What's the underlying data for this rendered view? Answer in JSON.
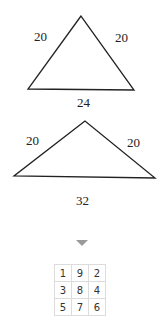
{
  "triangle_1": {
    "left_side": "20",
    "right_side": "20",
    "base": "24"
  },
  "triangle_2": {
    "left_side": "20",
    "right_side": "20",
    "base": "32"
  },
  "indicator": {
    "icon": "down-triangle-arrow-icon",
    "color": "#9a9a9a"
  },
  "grid": {
    "rows": [
      [
        "1",
        "9",
        "2"
      ],
      [
        "3",
        "8",
        "4"
      ],
      [
        "5",
        "7",
        "6"
      ]
    ]
  }
}
